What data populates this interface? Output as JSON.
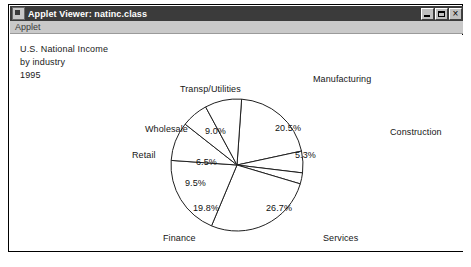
{
  "window": {
    "title": "Applet Viewer: natinc.class",
    "icon": "applet-icon",
    "controls": {
      "minimize": "minimize-icon",
      "maximize": "maximize-icon",
      "close": "close-icon"
    },
    "menu": {
      "items": [
        "Applet"
      ]
    }
  },
  "heading": {
    "line1": "U.S. National Income",
    "line2": "by industry",
    "line3": "1995"
  },
  "chart_data": {
    "type": "pie",
    "title": "U.S. National Income by industry 1995",
    "subtitle": "",
    "xlabel": "",
    "ylabel": "",
    "legend": "none",
    "grid": false,
    "value_suffix": "%",
    "categories": [
      "Manufacturing",
      "Construction",
      "Services",
      "Finance",
      "Retail",
      "Wholesale",
      "Transp/Utilities"
    ],
    "values": [
      20.5,
      5.3,
      26.7,
      19.8,
      9.5,
      6.5,
      9.0
    ],
    "labels": [
      "20.5%",
      "5.3%",
      "26.7%",
      "19.8%",
      "9.5%",
      "6.5%",
      "9.0%"
    ],
    "slices": [
      {
        "name": "Manufacturing",
        "value": 20.5,
        "label": "20.5%",
        "start_angle": -86,
        "end_angle": -12
      },
      {
        "name": "Construction",
        "value": 5.3,
        "label": "5.3%",
        "start_angle": -12,
        "end_angle": 7
      },
      {
        "name": "unlabeled-sliver",
        "value": 2.7,
        "label": "",
        "start_angle": 7,
        "end_angle": 0
      },
      {
        "name": "Services",
        "value": 26.7,
        "label": "26.7%",
        "start_angle": 0,
        "end_angle": 96
      },
      {
        "name": "Finance",
        "value": 19.8,
        "label": "19.8%",
        "start_angle": 96,
        "end_angle": 167
      },
      {
        "name": "Retail",
        "value": 9.5,
        "label": "9.5%",
        "start_angle": 167,
        "end_angle": 201
      },
      {
        "name": "Wholesale",
        "value": 6.5,
        "label": "6.5%",
        "start_angle": 201,
        "end_angle": 224
      },
      {
        "name": "Transp/Utilities",
        "value": 9.0,
        "label": "9.0%",
        "start_angle": 224,
        "end_angle": 274
      }
    ]
  },
  "colors": {
    "titlebar": "#3b3b3b",
    "titlebar_text": "#ffffff",
    "menubar": "#c9c9c9",
    "canvas": "#ffffff",
    "slice_fill": "#ffffff",
    "slice_stroke": "#202020",
    "text": "#101010"
  }
}
